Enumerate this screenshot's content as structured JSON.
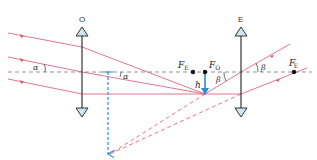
{
  "diagram": {
    "type": "optics-ray-diagram",
    "colors": {
      "ray": "#d9536f",
      "axis": "#777777",
      "lens": "#333333",
      "lens_head": "#cde7f0",
      "image_arrow": "#2a8fd8"
    },
    "lenses": [
      {
        "id": "objective",
        "label": "O",
        "x": 82
      },
      {
        "id": "eyepiece",
        "label": "E",
        "x": 241
      }
    ],
    "focal_points": [
      {
        "id": "FE",
        "label": "F",
        "sub": "E",
        "x": 193
      },
      {
        "id": "FO",
        "label": "F",
        "sub": "O",
        "x": 205
      },
      {
        "id": "FE_prime",
        "label": "F",
        "sub": "E",
        "prime": "′",
        "x": 294
      }
    ],
    "image": {
      "label": "h"
    },
    "angles": {
      "alpha": "α",
      "beta": "β"
    }
  }
}
